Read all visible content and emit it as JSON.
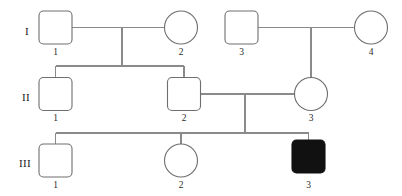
{
  "figure": {
    "type": "pedigree-chart",
    "title": "",
    "background_color": "#ffffff",
    "line_color": "#8a8a8a",
    "symbol_stroke_color": "#6e6e6e",
    "affected_fill_color": "#111111",
    "unaffected_fill_color": "#ffffff"
  },
  "generation_labels": [
    {
      "key": "gen1",
      "text": "I",
      "x": 25,
      "y": 35
    },
    {
      "key": "gen2",
      "text": "II",
      "x": 22,
      "y": 101
    },
    {
      "key": "gen3",
      "text": "III",
      "x": 19,
      "y": 167
    }
  ],
  "individuals": [
    {
      "id": "I-1",
      "generation": "I",
      "number": "1",
      "sex": "male",
      "shape": "square",
      "affected": false,
      "cx": 55.5,
      "cy": 27.5,
      "x": 39,
      "y": 11,
      "w": 33,
      "h": 33,
      "label_x": 55.5,
      "label_y": 55
    },
    {
      "id": "I-2",
      "generation": "I",
      "number": "2",
      "sex": "female",
      "shape": "circle",
      "affected": false,
      "cx": 181,
      "cy": 27.5,
      "r": 16.5,
      "label_x": 181,
      "label_y": 55
    },
    {
      "id": "I-3",
      "generation": "I",
      "number": "3",
      "sex": "male",
      "shape": "square",
      "affected": false,
      "cx": 241.5,
      "cy": 27.5,
      "x": 225,
      "y": 11,
      "w": 33,
      "h": 33,
      "label_x": 241.5,
      "label_y": 55
    },
    {
      "id": "I-4",
      "generation": "I",
      "number": "4",
      "sex": "female",
      "shape": "circle",
      "affected": false,
      "cx": 371,
      "cy": 27.5,
      "r": 16.5,
      "label_x": 371,
      "label_y": 55
    },
    {
      "id": "II-1",
      "generation": "II",
      "number": "1",
      "sex": "male",
      "shape": "square",
      "affected": false,
      "cx": 55.5,
      "cy": 94,
      "x": 39,
      "y": 77.5,
      "w": 33,
      "h": 33,
      "label_x": 55.5,
      "label_y": 121
    },
    {
      "id": "II-2",
      "generation": "II",
      "number": "2",
      "sex": "male",
      "shape": "square",
      "affected": false,
      "cx": 184,
      "cy": 94,
      "x": 167.5,
      "y": 77.5,
      "w": 33,
      "h": 33,
      "label_x": 184,
      "label_y": 121
    },
    {
      "id": "II-3",
      "generation": "II",
      "number": "3",
      "sex": "female",
      "shape": "circle",
      "affected": false,
      "cx": 311,
      "cy": 94,
      "r": 16.5,
      "label_x": 311,
      "label_y": 121
    },
    {
      "id": "III-1",
      "generation": "III",
      "number": "1",
      "sex": "male",
      "shape": "square",
      "affected": false,
      "cx": 55.5,
      "cy": 160.5,
      "x": 39,
      "y": 144,
      "w": 33,
      "h": 33,
      "label_x": 55.5,
      "label_y": 188
    },
    {
      "id": "III-2",
      "generation": "III",
      "number": "2",
      "sex": "female",
      "shape": "circle",
      "affected": false,
      "cx": 181,
      "cy": 160.5,
      "r": 16.5,
      "label_x": 181,
      "label_y": 188
    },
    {
      "id": "III-3",
      "generation": "III",
      "number": "3",
      "sex": "male",
      "shape": "square",
      "affected": true,
      "cx": 308.5,
      "cy": 156.5,
      "x": 292,
      "y": 140,
      "w": 33,
      "h": 33,
      "label_x": 308.5,
      "label_y": 188
    }
  ],
  "matings": [
    {
      "key": "mating-I1-I2",
      "partners": [
        "I-1",
        "I-2"
      ],
      "line_y": 27.5,
      "x_start": 72,
      "x_end": 164.5,
      "drop_x": 122,
      "drop_to_y": 66,
      "children": [
        "II-1",
        "II-2"
      ],
      "sibship_y": 66,
      "sibship_x_start": 55.5,
      "sibship_x_end": 184
    },
    {
      "key": "mating-I3-I4",
      "partners": [
        "I-3",
        "I-4"
      ],
      "line_y": 27.5,
      "x_start": 258,
      "x_end": 354.5,
      "drop_x": 311,
      "drop_to_y": 77.5,
      "children": [
        "II-3"
      ],
      "sibship_y": null,
      "sibship_x_start": null,
      "sibship_x_end": null
    },
    {
      "key": "mating-II2-II3",
      "partners": [
        "II-2",
        "II-3"
      ],
      "line_y": 94,
      "x_start": 200.5,
      "x_end": 294.5,
      "drop_x": 245,
      "drop_to_y": 133,
      "children": [
        "III-1",
        "III-2",
        "III-3"
      ],
      "sibship_y": 133,
      "sibship_x_start": 55.5,
      "sibship_x_end": 308.5
    }
  ],
  "legend": {
    "square_meaning": "male",
    "circle_meaning": "female",
    "filled_meaning": "affected",
    "open_meaning": "unaffected"
  }
}
